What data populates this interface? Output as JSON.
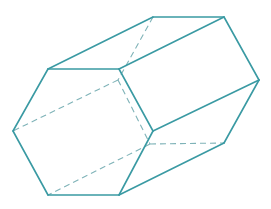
{
  "diagram": {
    "colors": {
      "stroke": "#3a9aa3",
      "hidden_stroke": "#7fb3b8",
      "background": "#ffffff"
    },
    "vertices": {
      "front": [
        [
          48,
          69
        ],
        [
          119,
          69
        ],
        [
          153,
          131
        ],
        [
          119,
          195
        ],
        [
          48,
          195
        ],
        [
          13,
          131
        ]
      ],
      "back": [
        [
          153,
          17
        ],
        [
          224,
          17
        ],
        [
          259,
          80
        ],
        [
          224,
          143
        ],
        [
          150,
          144
        ],
        [
          118,
          80
        ]
      ]
    },
    "visible_edges": [
      [
        [
          48,
          69
        ],
        [
          119,
          69
        ]
      ],
      [
        [
          119,
          69
        ],
        [
          153,
          131
        ]
      ],
      [
        [
          153,
          131
        ],
        [
          119,
          195
        ]
      ],
      [
        [
          119,
          195
        ],
        [
          48,
          195
        ]
      ],
      [
        [
          48,
          195
        ],
        [
          13,
          131
        ]
      ],
      [
        [
          13,
          131
        ],
        [
          48,
          69
        ]
      ],
      [
        [
          153,
          17
        ],
        [
          224,
          17
        ]
      ],
      [
        [
          224,
          17
        ],
        [
          259,
          80
        ]
      ],
      [
        [
          259,
          80
        ],
        [
          224,
          143
        ]
      ],
      [
        [
          48,
          69
        ],
        [
          153,
          17
        ]
      ],
      [
        [
          119,
          69
        ],
        [
          224,
          17
        ]
      ],
      [
        [
          153,
          131
        ],
        [
          259,
          80
        ]
      ],
      [
        [
          119,
          195
        ],
        [
          224,
          143
        ]
      ]
    ],
    "hidden_edges": [
      [
        [
          153,
          17
        ],
        [
          118,
          80
        ]
      ],
      [
        [
          118,
          80
        ],
        [
          150,
          144
        ]
      ],
      [
        [
          150,
          144
        ],
        [
          224,
          143
        ]
      ],
      [
        [
          118,
          80
        ],
        [
          13,
          131
        ]
      ],
      [
        [
          150,
          144
        ],
        [
          48,
          195
        ]
      ]
    ]
  }
}
